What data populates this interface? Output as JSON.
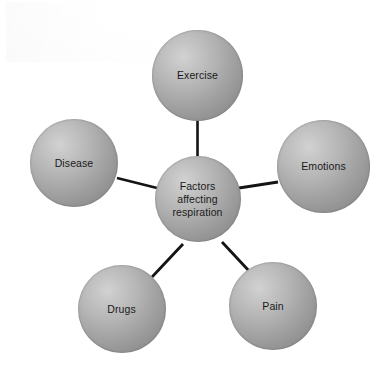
{
  "diagram": {
    "title": "Factors affecting respiration",
    "type": "hub-and-spoke concept map",
    "background_color": "#ffffff",
    "node_fill_light": "#d2d2d2",
    "node_fill_dark": "#7e7e7e",
    "edge_color": "#141414",
    "text_color": "#1a1a1a",
    "center": {
      "id": "center",
      "label": "Factors\naffecting\nrespiration",
      "cx": 197.5,
      "cy": 199,
      "r": 43
    },
    "nodes": [
      {
        "id": "exercise",
        "label": "Exercise",
        "cx": 197.5,
        "cy": 75,
        "r": 45.5
      },
      {
        "id": "emotions",
        "label": "Emotions",
        "cx": 323.5,
        "cy": 166,
        "r": 46.5
      },
      {
        "id": "pain",
        "label": "Pain",
        "cx": 273,
        "cy": 306,
        "r": 44
      },
      {
        "id": "drugs",
        "label": "Drugs",
        "cx": 121.5,
        "cy": 309,
        "r": 44
      },
      {
        "id": "disease",
        "label": "Disease",
        "cx": 74,
        "cy": 163,
        "r": 44
      }
    ],
    "edges": [
      {
        "id": "edge-center-exercise",
        "from": "center",
        "to": "exercise",
        "x1": 197.5,
        "y1": 156,
        "x2": 197.5,
        "y2": 120
      },
      {
        "id": "edge-center-emotions",
        "from": "center",
        "to": "emotions",
        "x1": 239,
        "y1": 188,
        "x2": 278,
        "y2": 182
      },
      {
        "id": "edge-center-pain",
        "from": "center",
        "to": "pain",
        "x1": 222,
        "y1": 242,
        "x2": 250,
        "y2": 272
      },
      {
        "id": "edge-center-drugs",
        "from": "center",
        "to": "drugs",
        "x1": 183,
        "y1": 244,
        "x2": 152,
        "y2": 277
      },
      {
        "id": "edge-center-disease",
        "from": "center",
        "to": "disease",
        "x1": 157,
        "y1": 188,
        "x2": 117,
        "y2": 178
      }
    ]
  }
}
